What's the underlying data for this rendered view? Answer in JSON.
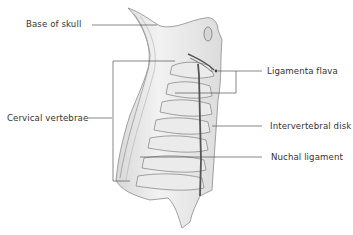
{
  "figure": {
    "labels": {
      "base_of_skull": "Base of skull",
      "cervical_vertebrae": "Cervical vertebrae",
      "ligamenta_flava": "Ligamenta flava",
      "intervertebral_disk": "Intervertebral disk",
      "nuchal_ligament": "Nuchal ligament"
    },
    "colors": {
      "leader_line": "#555555",
      "text": "#333333",
      "bone_fill": "#e6e6e6",
      "bone_stroke": "#8a8a8a",
      "ligament": "#555555"
    }
  }
}
